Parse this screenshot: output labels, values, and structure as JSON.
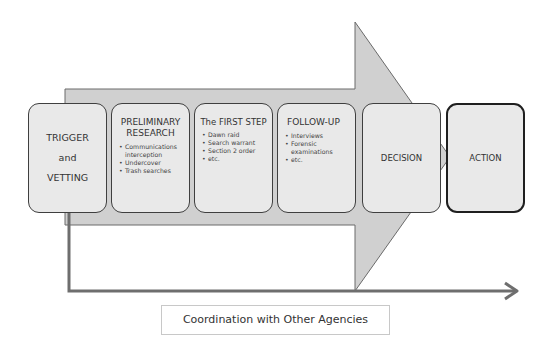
{
  "diagram": {
    "stages": [
      {
        "id": "trigger",
        "title_lines": [
          "TRIGGER",
          "and",
          "VETTING"
        ],
        "items": []
      },
      {
        "id": "preliminary",
        "title": "PRELIMINARY RESEARCH",
        "items": [
          "Communications interception",
          "Undercover",
          "Trash searches"
        ]
      },
      {
        "id": "first-step",
        "title": "The FIRST STEP",
        "items": [
          "Dawn raid",
          "Search warrant",
          "Section 2 order",
          "etc."
        ]
      },
      {
        "id": "follow-up",
        "title": "FOLLOW-UP",
        "items": [
          "Interviews",
          "Forensic examinations",
          "etc."
        ]
      },
      {
        "id": "decision",
        "title": "DECISION",
        "items": []
      },
      {
        "id": "action",
        "title": "ACTION",
        "items": []
      }
    ],
    "coordination_label": "Coordination with Other Agencies",
    "colors": {
      "arrow_fill": "#d0d0d0",
      "arrow_stroke": "#6a6a6a",
      "box_fill": "#e9e9e9",
      "line": "#6e6e6e"
    }
  }
}
